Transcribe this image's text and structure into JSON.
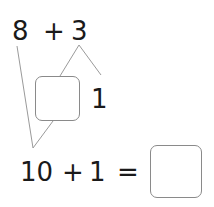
{
  "problem": {
    "top_expression": {
      "left": "8",
      "operator": "+",
      "right": "3"
    },
    "split_of_3": {
      "first_part": "",
      "second_part": "1"
    },
    "bottom_expression": {
      "left": "10",
      "operator": "+",
      "right": "1",
      "equals": "=",
      "answer": ""
    }
  },
  "colors": {
    "text": "#1a1a1a",
    "lines": "#9a9a9a",
    "box_border": "#8a8a8a"
  }
}
